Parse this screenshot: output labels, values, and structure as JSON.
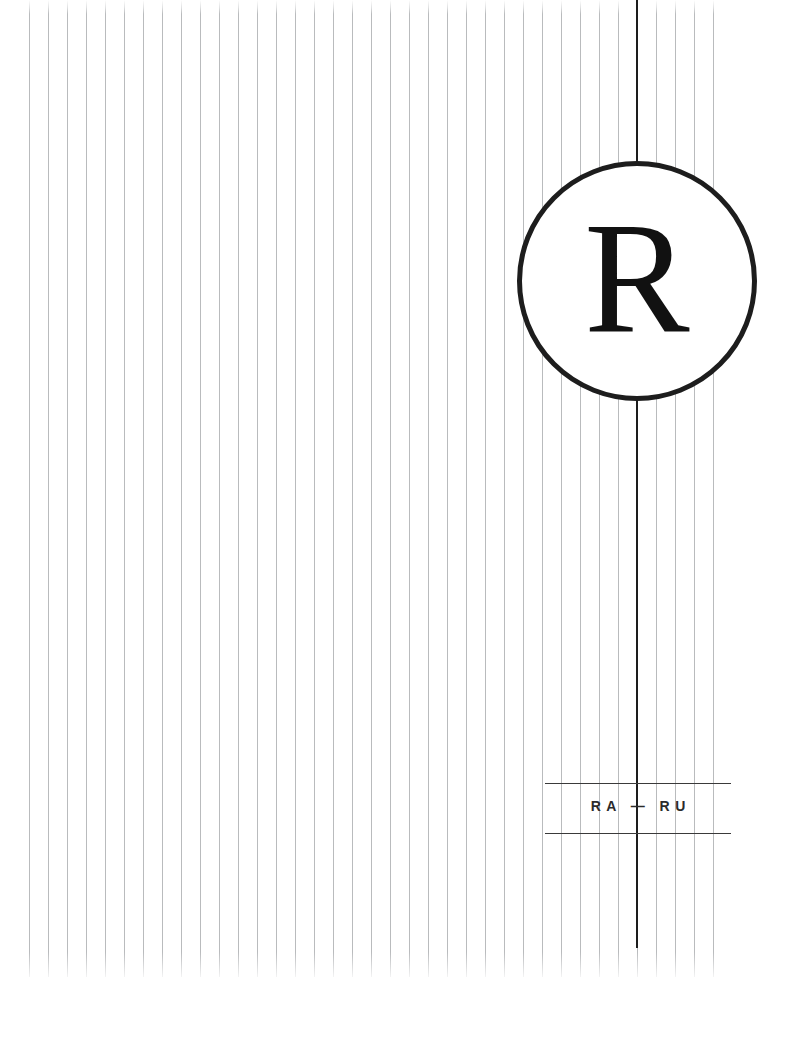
{
  "poster": {
    "background_color": "#ffffff",
    "width_px": 798,
    "height_px": 1063
  },
  "emblem": {
    "name": "circular-monogram",
    "letter": "R",
    "stroke_color": "#1d1d1d",
    "letter_color": "#111111",
    "fill_color": "#ffffff",
    "center_x_px": 637,
    "center_y_px": 281,
    "diameter_px": 240
  },
  "center_rule": {
    "color": "#1d1d1d",
    "x_px": 637,
    "top_px": 0,
    "bottom_px": 948,
    "width_px": 2
  },
  "stripes": {
    "color": "#b9bbbd",
    "spacing_px": 19,
    "line_width_px": 1,
    "left_px": 29,
    "right_px": 731,
    "top_px": 0,
    "bottom_px": 977
  },
  "wordmark": {
    "text": "RA — RU",
    "color": "#2b2b2b",
    "rule_color": "#3a3a3a",
    "rule_top_y_px": 783,
    "rule_bottom_y_px": 833,
    "rule_left_px": 545,
    "rule_right_px": 731
  }
}
